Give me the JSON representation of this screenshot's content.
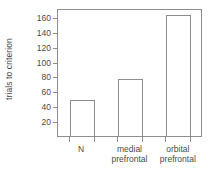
{
  "chart_data": {
    "type": "bar",
    "title": "",
    "xlabel": "",
    "ylabel": "trials to criterion",
    "categories": [
      "N",
      "medial\nprefrontal",
      "orbital\nprefrontal"
    ],
    "values": [
      48,
      77,
      163
    ],
    "ylim": [
      0,
      172
    ],
    "yticks": [
      20,
      40,
      60,
      80,
      100,
      120,
      140,
      160
    ],
    "ytick_labels": [
      "20",
      "40",
      "60",
      "80",
      "100",
      "120",
      "140",
      "160"
    ],
    "grid": false,
    "legend": "none",
    "bar_fill": "#ffffff",
    "bar_edge_color": "#8d8d8d",
    "axis_color": "#8d8d8d",
    "background": "#ffffff",
    "text_color": "#4a4a4a"
  }
}
